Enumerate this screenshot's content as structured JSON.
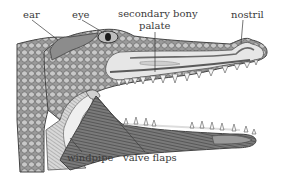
{
  "diagram": {
    "labels": {
      "ear": "ear",
      "eye": "eye",
      "palate_line1": "secondary bony",
      "palate_line2": "palate",
      "nostril": "nostril",
      "windpipe": "windpipe",
      "valve_flaps": "valve flaps"
    },
    "colors": {
      "background": "#ffffff",
      "outline": "#4a4a4a",
      "scales": "#8a8a8a",
      "skin_light": "#d6d6d6",
      "tissue_pale": "#e8e8e8",
      "muscle_dark": "#6e6e6e",
      "label_text": "#3a3a3a",
      "leader_line": "#3a3a3a"
    }
  }
}
